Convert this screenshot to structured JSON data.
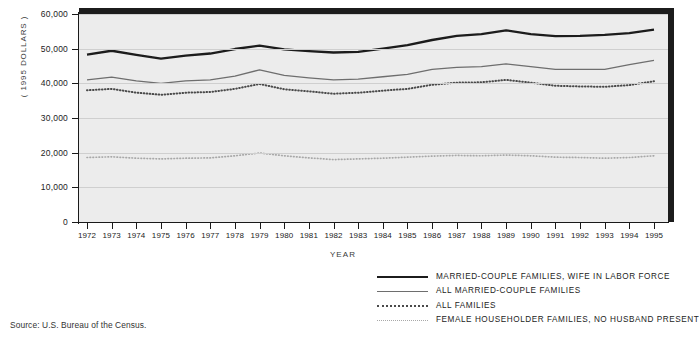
{
  "figure": {
    "source_note": "Source: U.S. Bureau of the Census.",
    "ylabel": "( 1995 DOLLARS )",
    "xlabel": "YEAR"
  },
  "legend": {
    "items": [
      {
        "label": "MARRIED-COUPLE FAMILIES, WIFE IN LABOR FORCE",
        "style": "thick-black-solid",
        "icon": "line-sample-icon"
      },
      {
        "label": "ALL MARRIED-COUPLE FAMILIES",
        "style": "thin-gray-solid",
        "icon": "line-sample-icon"
      },
      {
        "label": "ALL FAMILIES",
        "style": "dark-dotted",
        "icon": "line-sample-icon"
      },
      {
        "label": "FEMALE HOUSEHOLDER FAMILIES, NO HUSBAND PRESENT",
        "style": "light-dotted",
        "icon": "line-sample-icon"
      }
    ]
  },
  "chart_data": {
    "type": "line",
    "title": "",
    "xlabel": "YEAR",
    "ylabel": "( 1995 DOLLARS )",
    "xlim": [
      1972,
      1995
    ],
    "ylim": [
      0,
      60000
    ],
    "yticks": [
      0,
      10000,
      20000,
      30000,
      40000,
      50000,
      60000
    ],
    "ytick_labels": [
      "0",
      "10,000",
      "20,000",
      "30,000",
      "40,000",
      "50,000",
      "60,000"
    ],
    "grid": true,
    "legend_position": "below-right",
    "categories": [
      1972,
      1973,
      1974,
      1975,
      1976,
      1977,
      1978,
      1979,
      1980,
      1981,
      1982,
      1983,
      1984,
      1985,
      1986,
      1987,
      1988,
      1989,
      1990,
      1991,
      1992,
      1993,
      1994,
      1995
    ],
    "xtick_labels": [
      "1972",
      "1973",
      "1974",
      "1975",
      "1976",
      "1977",
      "1978",
      "1979",
      "1980",
      "1981",
      "1982",
      "1983",
      "1984",
      "1985",
      "1986",
      "1987",
      "1988",
      "1989",
      "1990",
      "1991",
      "1992",
      "1993",
      "1994",
      "1995"
    ],
    "series": [
      {
        "name": "MARRIED-COUPLE FAMILIES, WIFE IN LABOR FORCE",
        "style": "thick-black-solid",
        "color": "#1c1c1c",
        "values": [
          48300,
          49400,
          48200,
          47100,
          48000,
          48600,
          49900,
          50900,
          49800,
          49300,
          48900,
          49100,
          50000,
          51000,
          52500,
          53700,
          54200,
          55300,
          54200,
          53600,
          53700,
          54000,
          54500,
          55500
        ]
      },
      {
        "name": "ALL MARRIED-COUPLE FAMILIES",
        "style": "thin-gray-solid",
        "color": "#6e6e6e",
        "values": [
          41000,
          41800,
          40700,
          40000,
          40700,
          41000,
          42100,
          43900,
          42300,
          41600,
          41000,
          41200,
          41900,
          42600,
          44000,
          44600,
          44800,
          45600,
          44800,
          44000,
          44000,
          44000,
          45400,
          46600
        ]
      },
      {
        "name": "ALL FAMILIES",
        "style": "dark-dotted",
        "color": "#4a4a4a",
        "values": [
          38000,
          38400,
          37300,
          36700,
          37300,
          37500,
          38400,
          39800,
          38300,
          37700,
          37000,
          37300,
          37900,
          38400,
          39600,
          40200,
          40300,
          41000,
          40200,
          39300,
          39100,
          39000,
          39500,
          40600
        ]
      },
      {
        "name": "FEMALE HOUSEHOLDER FAMILIES, NO HUSBAND PRESENT",
        "style": "light-dotted",
        "color": "#a8a8a8",
        "values": [
          18600,
          18800,
          18400,
          18200,
          18400,
          18500,
          19100,
          19900,
          19100,
          18500,
          18000,
          18200,
          18400,
          18700,
          19000,
          19200,
          19100,
          19300,
          19100,
          18700,
          18600,
          18400,
          18600,
          19100
        ]
      }
    ]
  }
}
